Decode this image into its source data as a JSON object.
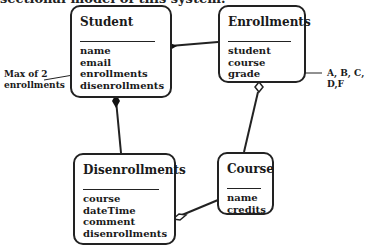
{
  "caption": "sectional model of this system.",
  "classes": {
    "student": {
      "title": "Student",
      "attributes": [
        "name",
        "email",
        "enrollments",
        "disenrollments"
      ]
    },
    "enrollments": {
      "title": "Enrollments",
      "attributes": [
        "student",
        "course",
        "grade"
      ]
    },
    "disenrollments": {
      "title": "Disenrollments",
      "attributes": [
        "course",
        "dateTime",
        "comment",
        "disenrollments"
      ]
    },
    "course": {
      "title": "Course",
      "attributes": [
        "name",
        "credits"
      ]
    }
  },
  "notes": {
    "max_enrollments": [
      "Max of 2",
      "enrollments"
    ],
    "grade_values": "A, B, C, D,F"
  },
  "relationships": [
    {
      "from": "Student",
      "to": "Enrollments",
      "type": "composition"
    },
    {
      "from": "Student",
      "to": "Disenrollments",
      "type": "composition"
    },
    {
      "from": "Enrollments",
      "to": "Course",
      "type": "aggregation"
    },
    {
      "from": "Disenrollments",
      "to": "Course",
      "type": "aggregation"
    }
  ]
}
